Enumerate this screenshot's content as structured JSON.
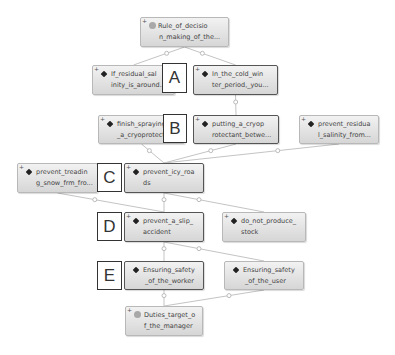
{
  "diagram": {
    "nodes": [
      {
        "id": "root",
        "line1": "Rule_of_decisio",
        "line2": "n_making_of_the...",
        "icon": "circle-icon",
        "emphasized": false
      },
      {
        "id": "if_residual",
        "line1": "If_residual_sal",
        "line2": "inity_is_around...",
        "icon": "diamond-icon",
        "emphasized": false
      },
      {
        "id": "in_the_cold",
        "line1": "In_the_cold_win",
        "line2": "ter_period,_you...",
        "icon": "diamond-icon",
        "emphasized": true
      },
      {
        "id": "finish_spraying",
        "line1": "finish_spraying",
        "line2": "_a_cryoprotect...",
        "icon": "diamond-icon",
        "emphasized": false
      },
      {
        "id": "putting",
        "line1": "putting_a_cryop",
        "line2": "rotectant_betwe...",
        "icon": "diamond-icon",
        "emphasized": true
      },
      {
        "id": "prevent_residual",
        "line1": "prevent_residua",
        "line2": "l_salinity_from...",
        "icon": "diamond-icon",
        "emphasized": false
      },
      {
        "id": "prevent_treading",
        "line1": "prevent_treadin",
        "line2": "g_snow_frm_fro...",
        "icon": "diamond-icon",
        "emphasized": false
      },
      {
        "id": "prevent_icy",
        "line1": "prevent_icy_roa",
        "line2": "ds",
        "icon": "diamond-icon",
        "emphasized": true
      },
      {
        "id": "prevent_slip",
        "line1": "prevent_a_slip_",
        "line2": "accident",
        "icon": "diamond-icon",
        "emphasized": true
      },
      {
        "id": "do_not_produce",
        "line1": "do_not_produce_",
        "line2": "stock",
        "icon": "diamond-icon",
        "emphasized": false
      },
      {
        "id": "ensuring_worker",
        "line1": "Ensuring_safety",
        "line2": "_of_the_worker",
        "icon": "diamond-icon",
        "emphasized": true
      },
      {
        "id": "ensuring_user",
        "line1": "Ensuring_safety",
        "line2": "_of_the_user",
        "icon": "diamond-icon",
        "emphasized": false
      },
      {
        "id": "duties",
        "line1": "Duties_target_o",
        "line2": "f_the_manager",
        "icon": "circle-icon",
        "emphasized": false
      }
    ],
    "markers": [
      "A",
      "B",
      "C",
      "D",
      "E"
    ],
    "expand_symbol": "+",
    "edges": [
      [
        "root",
        "if_residual"
      ],
      [
        "root",
        "in_the_cold"
      ],
      [
        "in_the_cold",
        "putting"
      ],
      [
        "finish_spraying",
        "prevent_icy"
      ],
      [
        "putting",
        "prevent_icy"
      ],
      [
        "prevent_residual",
        "prevent_icy"
      ],
      [
        "prevent_treading",
        "prevent_slip"
      ],
      [
        "prevent_icy",
        "prevent_slip"
      ],
      [
        "prevent_icy",
        "do_not_produce"
      ],
      [
        "prevent_slip",
        "ensuring_worker"
      ],
      [
        "prevent_slip",
        "ensuring_user"
      ],
      [
        "ensuring_worker",
        "duties"
      ],
      [
        "ensuring_user",
        "duties"
      ]
    ]
  }
}
